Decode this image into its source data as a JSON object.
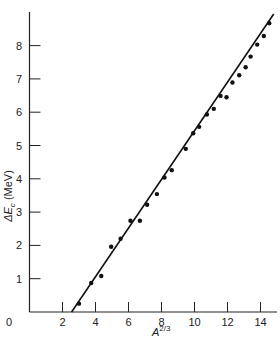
{
  "chart_data": {
    "type": "scatter",
    "title": "",
    "xlabel": "A^{2/3}",
    "ylabel": "ΔE_c (MeV)",
    "xlim": [
      0,
      15
    ],
    "ylim": [
      0,
      9
    ],
    "grid": false,
    "legend": null,
    "x_ticks": [
      0,
      2,
      4,
      6,
      8,
      10,
      12,
      14
    ],
    "y_ticks": [
      1,
      2,
      3,
      4,
      5,
      6,
      7,
      8
    ],
    "series": [
      {
        "name": "data points",
        "type": "scatter",
        "x": [
          3.0,
          3.74,
          4.35,
          4.95,
          5.52,
          6.12,
          6.69,
          7.13,
          7.72,
          8.18,
          8.62,
          9.47,
          9.92,
          10.28,
          10.75,
          11.17,
          11.58,
          11.94,
          12.3,
          12.71,
          13.1,
          13.4,
          13.8,
          14.2,
          14.53
        ],
        "y": [
          0.25,
          0.87,
          1.08,
          1.96,
          2.2,
          2.74,
          2.74,
          3.22,
          3.54,
          4.04,
          4.26,
          4.9,
          5.37,
          5.56,
          5.93,
          6.1,
          6.49,
          6.45,
          6.89,
          7.11,
          7.35,
          7.67,
          8.03,
          8.29,
          8.67
        ]
      },
      {
        "name": "linear fit",
        "type": "line",
        "x": [
          2.55,
          14.8
        ],
        "y": [
          0,
          8.95
        ]
      }
    ]
  },
  "axes": {
    "x_tick_labels": [
      "0",
      "2",
      "4",
      "6",
      "8",
      "10",
      "12",
      "14"
    ],
    "y_tick_labels": [
      "1",
      "2",
      "3",
      "4",
      "5",
      "6",
      "7",
      "8"
    ],
    "x_title_base": "A",
    "x_title_sup": "2/3",
    "y_title_delta": "ΔE",
    "y_title_sub": "c",
    "y_title_unit": " (MeV)"
  }
}
